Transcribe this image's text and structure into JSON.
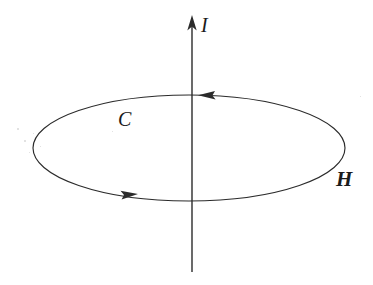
{
  "figure": {
    "background_color": "#ffffff",
    "stroke_color": "#2b2b2b",
    "label_color": "#1b1b1b",
    "width": 373,
    "height": 285
  },
  "labels": {
    "current": "I",
    "contour": "C",
    "field": "H"
  },
  "elements": {
    "wire_axis": {
      "name": "current-axis",
      "x": 192,
      "y_top": 15,
      "y_bottom": 272,
      "arrow_direction": "up"
    },
    "contour_ellipse": {
      "name": "contour-ellipse",
      "center_x": 189,
      "center_y": 148,
      "radius_x": 156,
      "radius_y": 53,
      "circulation": "counterclockwise-from-above"
    },
    "arrow_top": {
      "name": "contour-arrow-top",
      "x": 205,
      "y": 95,
      "direction": "left"
    },
    "arrow_bottom": {
      "name": "contour-arrow-bottom",
      "x": 128,
      "y": 195,
      "direction": "right"
    }
  },
  "specks": [
    {
      "x": 17,
      "y": 128,
      "d": 2
    },
    {
      "x": 24,
      "y": 140,
      "d": 2
    },
    {
      "x": 33,
      "y": 133,
      "d": 1
    },
    {
      "x": 29,
      "y": 152,
      "d": 1
    },
    {
      "x": 40,
      "y": 146,
      "d": 1
    },
    {
      "x": 112,
      "y": 131,
      "d": 1
    },
    {
      "x": 360,
      "y": 96,
      "d": 1
    }
  ]
}
